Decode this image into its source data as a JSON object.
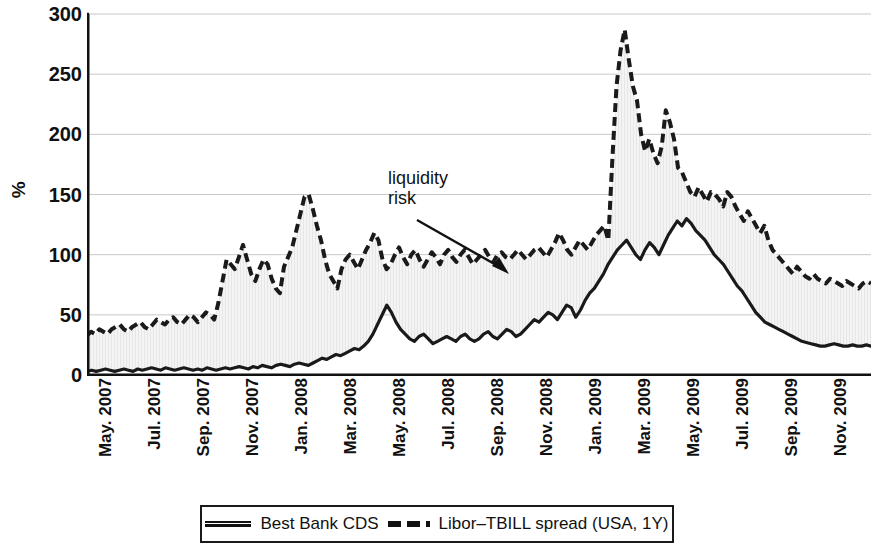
{
  "axes": {
    "ylabel": "%",
    "yticks": [
      0,
      50,
      100,
      150,
      200,
      250,
      300
    ],
    "ymin": 0,
    "ymax": 300,
    "xticks": [
      "May. 2007",
      "Jul. 2007",
      "Sep. 2007",
      "Nov. 2007",
      "Jan. 2008",
      "Mar. 2008",
      "May. 2008",
      "Jul. 2008",
      "Sep. 2008",
      "Nov. 2008",
      "Jan. 2009",
      "Mar. 2009",
      "May. 2009",
      "Jul. 2009",
      "Sep. 2009",
      "Nov. 2009"
    ]
  },
  "annotations": [
    {
      "name": "liquidity-risk",
      "line1": "liquidity",
      "line2": "risk"
    }
  ],
  "legend": {
    "items": [
      {
        "label": "Best Bank CDS",
        "style": "solid",
        "color": "#111111"
      },
      {
        "label": "Libor–TBILL spread (USA, 1Y)",
        "style": "dash-dash-dot",
        "color": "#111111"
      }
    ]
  },
  "colors": {
    "line": "#1a1a1a",
    "fill": "#f0f0f0",
    "grid": "#c9c9c9",
    "axis": "#111111"
  },
  "chart_data": {
    "type": "line",
    "title": "",
    "xlabel": "",
    "ylabel": "%",
    "ylim": [
      0,
      300
    ],
    "grid": true,
    "legend_position": "bottom",
    "fill_between": true,
    "x": [
      "May 2007",
      "Jun 2007",
      "Jul 2007",
      "Aug 2007",
      "Sep 2007",
      "Oct 2007",
      "Nov 2007",
      "Dec 2007",
      "Jan 2008",
      "Feb 2008",
      "Mar 2008",
      "Apr 2008",
      "May 2008",
      "Jun 2008",
      "Jul 2008",
      "Aug 2008",
      "Sep 2008",
      "Oct 2008",
      "Nov 2008",
      "Dec 2008",
      "Jan 2009",
      "Feb 2009",
      "Mar 2009",
      "Apr 2009",
      "May 2009",
      "Jun 2009",
      "Jul 2009",
      "Aug 2009",
      "Sep 2009",
      "Oct 2009",
      "Nov 2009",
      "Dec 2009"
    ],
    "series": [
      {
        "name": "Best Bank CDS",
        "style": "solid",
        "values": [
          4,
          4,
          4,
          5,
          6,
          5,
          6,
          8,
          14,
          22,
          52,
          32,
          30,
          33,
          30,
          32,
          45,
          52,
          88,
          108,
          100,
          112,
          128,
          120,
          98,
          78,
          46,
          40,
          34,
          28,
          25,
          24
        ],
        "detail": [
          3,
          4,
          3,
          4,
          5,
          4,
          3,
          4,
          5,
          4,
          3,
          5,
          4,
          5,
          6,
          5,
          4,
          6,
          5,
          4,
          5,
          6,
          5,
          4,
          5,
          4,
          6,
          5,
          4,
          5,
          6,
          5,
          6,
          7,
          6,
          5,
          7,
          6,
          8,
          7,
          6,
          8,
          9,
          8,
          7,
          9,
          10,
          9,
          8,
          10,
          12,
          14,
          13,
          15,
          17,
          16,
          18,
          20,
          22,
          21,
          24,
          28,
          34,
          42,
          50,
          58,
          52,
          44,
          38,
          34,
          30,
          28,
          32,
          34,
          30,
          26,
          28,
          30,
          32,
          30,
          28,
          32,
          34,
          30,
          28,
          30,
          34,
          36,
          32,
          30,
          34,
          38,
          36,
          32,
          34,
          38,
          42,
          46,
          44,
          48,
          52,
          50,
          46,
          52,
          58,
          56,
          48,
          54,
          62,
          68,
          72,
          78,
          84,
          92,
          98,
          104,
          108,
          112,
          106,
          100,
          96,
          104,
          110,
          106,
          100,
          108,
          116,
          122,
          128,
          124,
          130,
          126,
          120,
          116,
          112,
          106,
          100,
          96,
          92,
          86,
          80,
          74,
          70,
          64,
          58,
          52,
          48,
          44,
          42,
          40,
          38,
          36,
          34,
          32,
          30,
          28,
          27,
          26,
          25,
          24,
          24,
          25,
          26,
          25,
          24,
          24,
          25,
          24,
          24,
          25,
          24
        ]
      },
      {
        "name": "Libor–TBILL spread (USA, 1Y)",
        "style": "dash-dash-dot",
        "values": [
          34,
          38,
          42,
          46,
          96,
          88,
          110,
          150,
          100,
          88,
          118,
          98,
          104,
          100,
          98,
          102,
          120,
          287,
          222,
          175,
          150,
          152,
          150,
          140,
          130,
          120,
          100,
          92,
          88,
          84,
          80,
          78
        ],
        "detail": [
          33,
          36,
          34,
          38,
          36,
          34,
          38,
          40,
          42,
          38,
          36,
          40,
          42,
          44,
          40,
          38,
          42,
          46,
          44,
          42,
          46,
          48,
          44,
          42,
          46,
          50,
          48,
          44,
          48,
          52,
          50,
          46,
          60,
          78,
          96,
          92,
          88,
          98,
          108,
          96,
          84,
          78,
          88,
          96,
          92,
          80,
          72,
          68,
          90,
          98,
          106,
          120,
          134,
          148,
          150,
          138,
          124,
          112,
          96,
          84,
          78,
          72,
          88,
          96,
          100,
          94,
          88,
          96,
          104,
          110,
          118,
          112,
          96,
          88,
          92,
          100,
          106,
          98,
          92,
          100,
          104,
          96,
          90,
          96,
          102,
          98,
          92,
          100,
          104,
          98,
          94,
          100,
          104,
          98,
          92,
          96,
          100,
          104,
          98,
          94,
          100,
          102,
          98,
          96,
          100,
          104,
          100,
          96,
          100,
          104,
          106,
          102,
          98,
          104,
          110,
          118,
          112,
          104,
          100,
          106,
          112,
          108,
          104,
          110,
          116,
          120,
          124,
          112,
          180,
          240,
          270,
          287,
          262,
          240,
          228,
          200,
          186,
          196,
          184,
          176,
          190,
          220,
          210,
          196,
          172,
          168,
          160,
          152,
          148,
          156,
          150,
          144,
          152,
          150,
          146,
          140,
          152,
          148,
          140,
          134,
          128,
          136,
          130,
          124,
          118,
          124,
          112,
          104,
          100,
          96,
          92,
          88,
          84,
          90,
          86,
          82,
          80,
          84,
          80,
          78,
          76,
          80,
          78,
          76,
          74,
          78,
          76,
          74,
          72,
          76,
          78,
          76
        ]
      }
    ],
    "annotations": [
      {
        "text": "liquidity risk",
        "points_to_x": "Sep 2008",
        "points_to_y": 100
      }
    ]
  }
}
